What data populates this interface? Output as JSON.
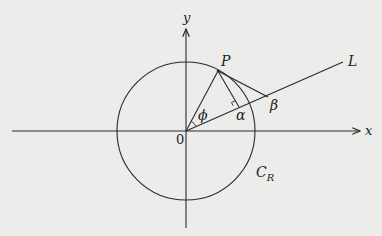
{
  "figure": {
    "type": "geometry-diagram",
    "labels": {
      "y_axis": "y",
      "x_axis": "x",
      "origin": "0",
      "point_P": "P",
      "line_L": "L",
      "angle_phi": "ϕ",
      "angle_alpha": "α",
      "angle_beta": "β",
      "circle_main": "C",
      "circle_sub": "R"
    },
    "colors": {
      "background": "#ececea",
      "ink": "#2a2a2a"
    }
  }
}
